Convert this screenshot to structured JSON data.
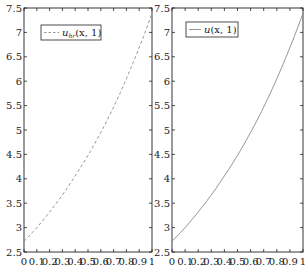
{
  "chart_data": [
    {
      "type": "line",
      "title": "",
      "xlabel": "",
      "ylabel": "",
      "xlim": [
        0,
        1
      ],
      "ylim": [
        2.5,
        7.5
      ],
      "x_ticks": [
        "0",
        "0.1",
        "0.2",
        "0.3",
        "0.4",
        "0.5",
        "0.6",
        "0.7",
        "0.8",
        "0.9",
        "1"
      ],
      "y_ticks": [
        "2.5",
        "3",
        "3.5",
        "4",
        "4.5",
        "5",
        "5.5",
        "6",
        "6.5",
        "7",
        "7.5"
      ],
      "grid": false,
      "legend_position": "upper left",
      "series": [
        {
          "name": "u_hr(x, 1)",
          "style": "dashed",
          "color": "#888888",
          "x": [
            0,
            0.1,
            0.2,
            0.3,
            0.4,
            0.5,
            0.6,
            0.7,
            0.8,
            0.9,
            1.0
          ],
          "values": [
            2.72,
            3.0,
            3.32,
            3.67,
            4.06,
            4.48,
            4.95,
            5.47,
            6.05,
            6.69,
            7.39
          ]
        }
      ]
    },
    {
      "type": "line",
      "title": "",
      "xlabel": "",
      "ylabel": "",
      "xlim": [
        0,
        1
      ],
      "ylim": [
        2.5,
        7.5
      ],
      "x_ticks": [
        "0",
        "0.1",
        "0.2",
        "0.3",
        "0.4",
        "0.5",
        "0.6",
        "0.7",
        "0.8",
        "0.9",
        "1"
      ],
      "y_ticks": [
        "2.5",
        "3",
        "3.5",
        "4",
        "4.5",
        "5",
        "5.5",
        "6",
        "6.5",
        "7",
        "7.5"
      ],
      "grid": false,
      "legend_position": "upper left",
      "series": [
        {
          "name": "u(x, 1)",
          "style": "solid",
          "color": "#888888",
          "x": [
            0,
            0.1,
            0.2,
            0.3,
            0.4,
            0.5,
            0.6,
            0.7,
            0.8,
            0.9,
            1.0
          ],
          "values": [
            2.72,
            3.0,
            3.32,
            3.67,
            4.06,
            4.48,
            4.95,
            5.47,
            6.05,
            6.69,
            7.39
          ]
        }
      ]
    }
  ],
  "legends": {
    "left": {
      "main": "u",
      "sub": "hr",
      "args": "(x, 1)"
    },
    "right": {
      "main": "u",
      "args": "(x, 1)"
    }
  },
  "colors": {
    "axis": "#222222",
    "curve": "#888888"
  }
}
